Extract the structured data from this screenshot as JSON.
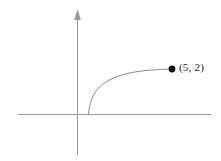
{
  "figure": {
    "background_color": "#ffffff",
    "axis_color": "#9a9a9a",
    "curve_color": "#8a8a8a",
    "point_color": "#111111",
    "label_color": "#1a1a1a"
  },
  "annotations": {
    "point_label": "(5, 2)"
  },
  "chart_data": {
    "type": "line",
    "title": "",
    "xlabel": "",
    "ylabel": "",
    "grid": false,
    "legend": null,
    "axes": {
      "x_axis": {
        "visible": true,
        "arrow": false,
        "pixel_y": 114,
        "pixel_x_start": 18,
        "pixel_x_end": 211
      },
      "y_axis": {
        "visible": true,
        "arrow": true,
        "arrow_direction": "up",
        "pixel_x": 77,
        "pixel_y_start": 10,
        "pixel_y_end": 155
      },
      "origin_pixel": [
        77,
        114
      ]
    },
    "series": [
      {
        "name": "curve",
        "description": "increasing concave-down curve rising from the x-axis to the marked endpoint",
        "points": [
          [
            88,
            114
          ],
          [
            90,
            104
          ],
          [
            93,
            96
          ],
          [
            98,
            89
          ],
          [
            105,
            83
          ],
          [
            115,
            78
          ],
          [
            128,
            75
          ],
          [
            145,
            72
          ],
          [
            160,
            70
          ],
          [
            172,
            69
          ]
        ]
      }
    ],
    "points": [
      {
        "label": "(5, 2)",
        "x": 5,
        "y": 2,
        "pixel": [
          172,
          69
        ],
        "marker": "filled-circle",
        "marker_radius": 3.4
      }
    ]
  }
}
